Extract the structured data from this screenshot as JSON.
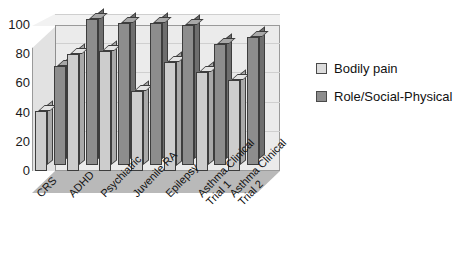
{
  "chart_data": {
    "type": "bar",
    "title": "",
    "subtitle": "",
    "xlabel": "",
    "ylabel": "",
    "ylim": [
      0,
      100
    ],
    "yticks": [
      0,
      20,
      40,
      60,
      80,
      100
    ],
    "grid": true,
    "projection": "3d",
    "legend_position": "right",
    "categories": [
      "CRS",
      "ADHD",
      "Psychiatric",
      "Juvenile RA",
      "Epilepsy",
      "Asthma Clinical Trial 1",
      "Asthma Clinical Trial 2"
    ],
    "category_lines": [
      [
        "CRS"
      ],
      [
        "ADHD"
      ],
      [
        "Psychiatric"
      ],
      [
        "Juvenile RA"
      ],
      [
        "Epilepsy"
      ],
      [
        "Asthma Clinical",
        "Trial 1"
      ],
      [
        "Asthma Clinical",
        "Trial 2"
      ]
    ],
    "series": [
      {
        "name": "Bodily pain",
        "color": "#cdcdcd",
        "values": [
          41,
          80,
          82,
          55,
          75,
          68,
          62
        ]
      },
      {
        "name": "Role/Social-Physical",
        "color": "#8d8d8d",
        "values": [
          68,
          100,
          97,
          97,
          96,
          83,
          88
        ]
      }
    ]
  },
  "legend": {
    "items": [
      {
        "label": "Bodily pain",
        "color": "#dcdcdc"
      },
      {
        "label": "Role/Social-Physical",
        "color": "#8d8d8d"
      }
    ]
  }
}
